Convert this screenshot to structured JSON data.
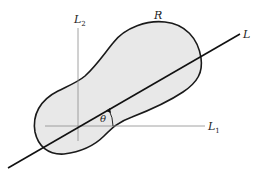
{
  "diagram": {
    "region_label": "R",
    "line_label": "L",
    "axis1_label": "L",
    "axis1_sub": "1",
    "axis2_label": "L",
    "axis2_sub": "2",
    "angle_label": "θ",
    "colors": {
      "region_fill": "#e8e8e8",
      "region_stroke": "#1a1a1a",
      "axis_stroke": "#8a8a8a",
      "line_stroke": "#111111",
      "background": "#ffffff"
    }
  }
}
